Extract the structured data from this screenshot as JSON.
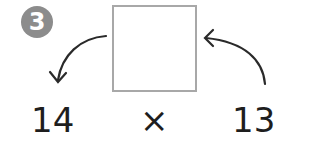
{
  "problem": {
    "number": "3",
    "operand1": "14",
    "operator": "×",
    "operand2": "13",
    "answer_box": ""
  },
  "colors": {
    "badge": "#8c8c8c",
    "text": "#1e1e1e",
    "box_border": "#a8a8a8"
  }
}
